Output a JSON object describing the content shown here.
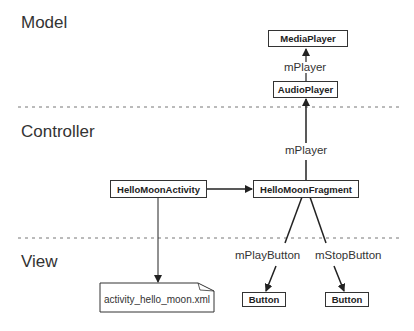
{
  "layers": {
    "model": "Model",
    "controller": "Controller",
    "view": "View"
  },
  "nodes": {
    "media_player": "MediaPlayer",
    "audio_player": "AudioPlayer",
    "hello_moon_activity": "HelloMoonActivity",
    "hello_moon_fragment": "HelloMoonFragment",
    "layout_file": "activity_hello_moon.xml",
    "play_button": "Button",
    "stop_button": "Button"
  },
  "edges": {
    "audio_to_media": "mPlayer",
    "fragment_to_audio": "mPlayer",
    "fragment_to_play": "mPlayButton",
    "fragment_to_stop": "mStopButton"
  },
  "colors": {
    "line": "#222222",
    "divider": "#777777",
    "background": "#ffffff"
  }
}
